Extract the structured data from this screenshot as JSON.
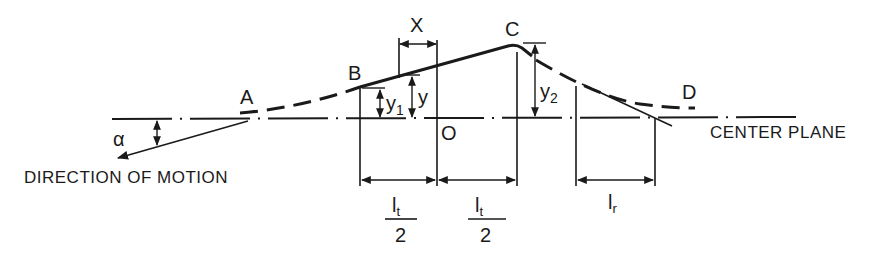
{
  "diagram": {
    "points": {
      "A": "A",
      "B": "B",
      "C": "C",
      "D": "D",
      "O": "O"
    },
    "angle_label": "α",
    "dimensions": {
      "x": "X",
      "y": "y",
      "y1_base": "y",
      "y1_sub": "1",
      "y2_base": "y",
      "y2_sub": "2",
      "lt_half_1": {
        "base": "l",
        "sub": "t",
        "denominator": "2"
      },
      "lt_half_2": {
        "base": "l",
        "sub": "t",
        "denominator": "2"
      },
      "lr": {
        "base": "l",
        "sub": "r"
      }
    },
    "captions": {
      "direction": "DIRECTION OF MOTION",
      "center_plane": "CENTER PLANE"
    },
    "colors": {
      "line": "#1a1a1a",
      "background": "#ffffff"
    }
  }
}
